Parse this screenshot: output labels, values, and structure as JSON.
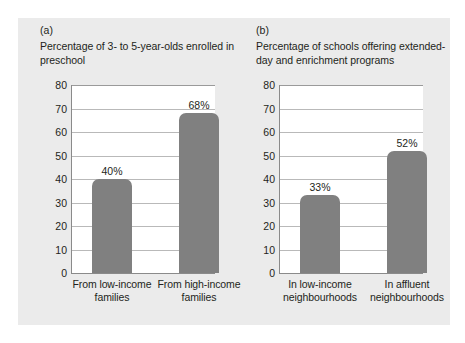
{
  "figure": {
    "background_color": "#ebebeb",
    "bar_color": "#808080",
    "text_color": "#231f20"
  },
  "chart_data": [
    {
      "type": "bar",
      "panel": "(a)",
      "title": "Percentage of 3- to 5-year-olds enrolled in preschool",
      "categories": [
        "From low-income families",
        "From high-income families"
      ],
      "values": [
        40,
        68
      ],
      "value_labels": [
        "40%",
        "68%"
      ],
      "xlabel": "",
      "ylabel": "",
      "ylim": [
        0,
        80
      ],
      "yticks": [
        80,
        70,
        60,
        50,
        40,
        30,
        20,
        10,
        0
      ],
      "ytick_labels": [
        "80",
        "70",
        "60",
        "50",
        "40",
        "30",
        "20",
        "10",
        "0"
      ],
      "grid": "horizontal",
      "legend": "none"
    },
    {
      "type": "bar",
      "panel": "(b)",
      "title": "Percentage of schools offering extended-day and enrichment programs",
      "categories": [
        "In low-income neighbourhoods",
        "In affluent neighbourhoods"
      ],
      "values": [
        33,
        52
      ],
      "value_labels": [
        "33%",
        "52%"
      ],
      "xlabel": "",
      "ylabel": "",
      "ylim": [
        0,
        80
      ],
      "yticks": [
        80,
        70,
        60,
        50,
        40,
        30,
        20,
        10,
        0
      ],
      "ytick_labels": [
        "80",
        "70",
        "60",
        "50",
        "40",
        "30",
        "20",
        "10",
        "0"
      ],
      "grid": "horizontal",
      "legend": "none"
    }
  ]
}
